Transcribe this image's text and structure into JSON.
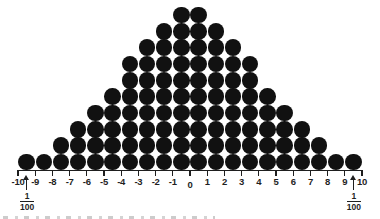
{
  "figure": {
    "background": "#ffffff"
  },
  "chart_data": {
    "type": "bar",
    "variant": "dot-histogram",
    "title": "",
    "xlabel": "",
    "ylabel": "",
    "xlim": [
      -10,
      10
    ],
    "ylim": [
      0,
      10
    ],
    "grid": false,
    "legend": null,
    "bin_centers": [
      -9.5,
      -8.5,
      -7.5,
      -6.5,
      -5.5,
      -4.5,
      -3.5,
      -2.5,
      -1.5,
      -0.5,
      0.5,
      1.5,
      2.5,
      3.5,
      4.5,
      5.5,
      6.5,
      7.5,
      8.5,
      9.5
    ],
    "counts": [
      1,
      1,
      2,
      3,
      4,
      5,
      7,
      8,
      9,
      10,
      10,
      9,
      8,
      7,
      5,
      4,
      3,
      2,
      1,
      1
    ],
    "total_dots": 100,
    "x_tick_values": [
      -10,
      -9,
      -8,
      -7,
      -6,
      -5,
      -4,
      -3,
      -2,
      -1,
      0,
      1,
      2,
      3,
      4,
      5,
      6,
      7,
      8,
      9,
      10
    ],
    "x_tick_labels": [
      "-10",
      "-9",
      "-8",
      "-7",
      "-6",
      "-5",
      "-4",
      "-3",
      "-2",
      "-1",
      "0",
      "1",
      "2",
      "3",
      "4",
      "5",
      "6",
      "7",
      "8",
      "9",
      "10"
    ],
    "annotations": [
      {
        "type": "fraction-arrow",
        "x": -9.5,
        "numerator": "1",
        "denominator": "100"
      },
      {
        "type": "fraction-arrow",
        "x": 9.5,
        "numerator": "1",
        "denominator": "100"
      }
    ]
  },
  "colors": {
    "dot": "#111111",
    "axis": "#1e1e1e",
    "tick_label": "#1f1f1f",
    "annotation": "#1f1f1f"
  }
}
